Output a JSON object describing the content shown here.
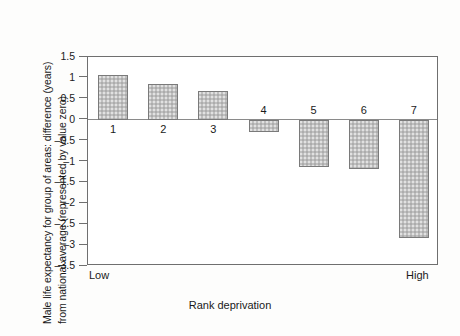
{
  "chart_data": {
    "type": "bar",
    "title": "",
    "subtitle": "",
    "xlabel": "Rank deprivation",
    "ylabel_line1": "Male life expectancy for group of areas: difference (years)",
    "ylabel_line2": "from national average (represented by value zero)",
    "categories": [
      "1",
      "2",
      "3",
      "4",
      "5",
      "6",
      "7"
    ],
    "values": [
      1.08,
      0.86,
      0.68,
      -0.3,
      -1.13,
      -1.18,
      -2.83
    ],
    "ylim": [
      -3.5,
      1.5
    ],
    "ytick_values": [
      1.5,
      1,
      0.5,
      0,
      -0.5,
      -1,
      -1.5,
      -2,
      -2.5,
      -3,
      -3.5
    ],
    "ytick_labels": [
      "1.5",
      "1",
      "0.5",
      "0",
      "–0.5",
      "–1",
      "–1.5",
      "–2",
      "–2.5",
      "–3",
      "–3.5"
    ],
    "x_axis_end_labels": {
      "left": "Low",
      "right": "High"
    },
    "grid": false,
    "legend": null,
    "zero_reference_line": 0,
    "bar_fill_color": "#bfbfbf",
    "bar_edge_color": "#7a7a7a",
    "axis_color": "#6f6f6f"
  }
}
